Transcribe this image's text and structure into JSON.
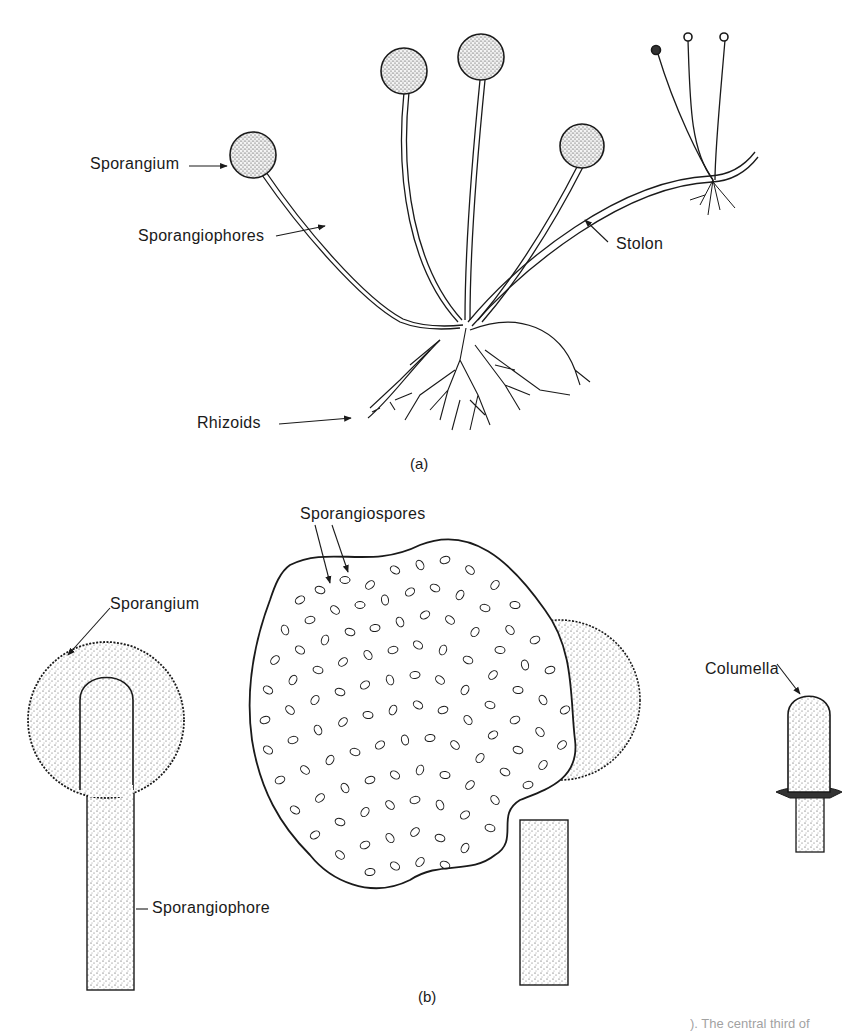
{
  "figure": {
    "panel_a": {
      "caption": "(a)",
      "labels": {
        "sporangium": "Sporangium",
        "sporangiophores": "Sporangiophores",
        "stolon": "Stolon",
        "rhizoids": "Rhizoids"
      }
    },
    "panel_b": {
      "caption": "(b)",
      "labels": {
        "sporangium": "Sporangium",
        "sporangiospores": "Sporangiospores",
        "columella": "Columella",
        "sporangiophore": "Sporangiophore"
      }
    },
    "bottom_caption_fragment": "). The central third of"
  },
  "colors": {
    "ink": "#1a1a1a",
    "background": "#ffffff"
  }
}
